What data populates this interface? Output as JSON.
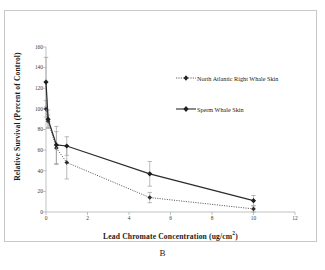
{
  "caption": "B",
  "chart_data": {
    "type": "line",
    "title": "",
    "subtitle": "",
    "xlabel": "Lead Chromate Concentration (ug/cm2)",
    "xlabel_base": "Lead Chromate Concentration (ug/cm",
    "xlabel_sup": "2",
    "xlabel_tail": ")",
    "ylabel": "Relative Survival (Percent of Control)",
    "xlim": [
      0,
      12
    ],
    "ylim": [
      0,
      160
    ],
    "xticks": [
      0,
      2,
      4,
      6,
      8,
      10,
      12
    ],
    "xticklabels": [
      "0",
      "2",
      "4",
      "6",
      "8",
      "10",
      "12"
    ],
    "yticks": [
      0,
      20,
      40,
      60,
      80,
      100,
      120,
      140,
      160
    ],
    "yticklabels": [
      "0",
      "20",
      "40",
      "60",
      "80",
      "100",
      "120",
      "140",
      "160"
    ],
    "grid": false,
    "legend_position": "upper right",
    "marker": "filled-diamond",
    "series": [
      {
        "name": "North Atlantic Right Whale Skin",
        "linestyle": "dotted",
        "color": "#333333",
        "x": [
          0,
          0.1,
          0.5,
          1,
          5,
          10
        ],
        "values": [
          100,
          88,
          62,
          48,
          14,
          3
        ],
        "errors": [
          8,
          6,
          16,
          16,
          5,
          3
        ]
      },
      {
        "name": "Sperm Whale Skin",
        "linestyle": "solid",
        "color": "#2b2b2b",
        "x": [
          0,
          0.1,
          0.5,
          1,
          5,
          10
        ],
        "values": [
          126,
          90,
          65,
          64,
          37,
          11
        ],
        "errors": [
          24,
          9,
          18,
          9,
          12,
          5
        ]
      }
    ]
  },
  "legend": {
    "items": [
      {
        "label": "North Atlantic Right Whale Skin",
        "style": "dotted"
      },
      {
        "label": "Sperm Whale Skin",
        "style": "solid"
      }
    ]
  },
  "colors": {
    "axis": "#9a9a9a",
    "text": "#1a1a1a",
    "series_dotted": "#333333",
    "series_solid": "#2b2b2b",
    "frame": "#c8c8c8"
  }
}
